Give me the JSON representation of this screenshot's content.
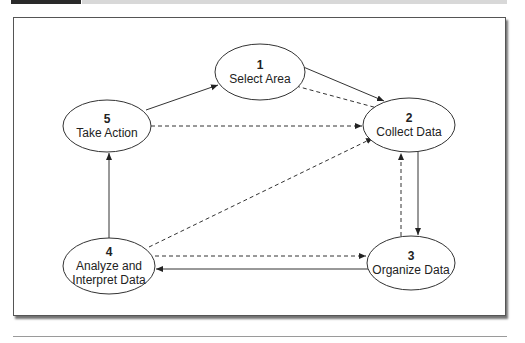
{
  "figure": {
    "nodes": [
      {
        "id": 1,
        "number": "1",
        "lines": [
          "Select Area"
        ],
        "cx": 260,
        "cy": 72,
        "rx": 45,
        "ry": 28
      },
      {
        "id": 2,
        "number": "2",
        "lines": [
          "Collect Data"
        ],
        "cx": 409,
        "cy": 125,
        "rx": 46,
        "ry": 27
      },
      {
        "id": 3,
        "number": "3",
        "lines": [
          "Organize Data"
        ],
        "cx": 411,
        "cy": 263,
        "rx": 44,
        "ry": 27
      },
      {
        "id": 4,
        "number": "4",
        "lines": [
          "Analyze and",
          "Interpret Data"
        ],
        "cx": 109,
        "cy": 266,
        "rx": 46,
        "ry": 28
      },
      {
        "id": 5,
        "number": "5",
        "lines": [
          "Take Action"
        ],
        "cx": 107,
        "cy": 126,
        "rx": 44,
        "ry": 26
      }
    ],
    "edges": [
      {
        "from": 1,
        "to": 2,
        "style": "solid"
      },
      {
        "from": 2,
        "to": 1,
        "style": "dashed"
      },
      {
        "from": 2,
        "to": 3,
        "style": "solid"
      },
      {
        "from": 3,
        "to": 2,
        "style": "dashed"
      },
      {
        "from": 3,
        "to": 4,
        "style": "solid"
      },
      {
        "from": 4,
        "to": 3,
        "style": "dashed"
      },
      {
        "from": 4,
        "to": 5,
        "style": "solid"
      },
      {
        "from": 4,
        "to": 2,
        "style": "dashed"
      },
      {
        "from": 5,
        "to": 1,
        "style": "solid"
      },
      {
        "from": 5,
        "to": 2,
        "style": "dashed"
      }
    ],
    "colors": {
      "line": "#333333",
      "fill": "#ffffff"
    }
  }
}
